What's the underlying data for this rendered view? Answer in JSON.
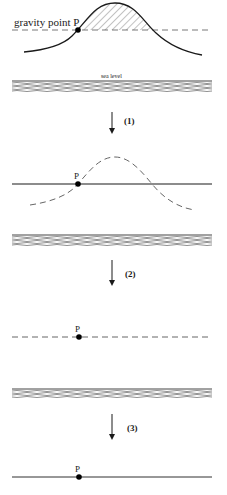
{
  "diagram": {
    "stages": [
      {
        "id": "original",
        "point_label": "gravity point P",
        "reference_line": "dashed",
        "terrain": "solid mountain with hatched mass above P level",
        "sea_label": "sea level"
      },
      {
        "id": "step1",
        "step_label": "(1)",
        "point_label": "P",
        "reference_line": "solid",
        "terrain": "dashed (removed) mountain"
      },
      {
        "id": "step2",
        "step_label": "(2)",
        "point_label": "P",
        "reference_line": "dashed"
      },
      {
        "id": "step3",
        "step_label": "(3)",
        "point_label": "P",
        "reference_line": "solid"
      }
    ],
    "colors": {
      "ink": "#1a1a1a",
      "dashed": "#555555",
      "water": "#444444",
      "background": "#ffffff"
    }
  }
}
